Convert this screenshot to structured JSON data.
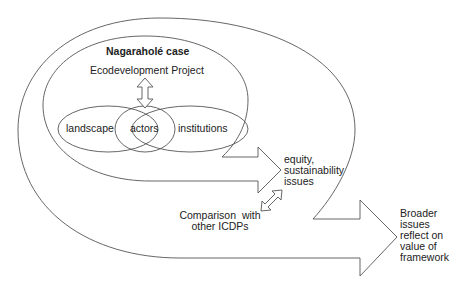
{
  "diagram": {
    "case_title": "Nagaraholé case",
    "project_label": "Ecodevelopment Project",
    "circles": [
      {
        "label": "landscape"
      },
      {
        "label": "actors"
      },
      {
        "label": "institutions"
      }
    ],
    "inner_outcome": {
      "lines": [
        "equity,",
        "sustainability",
        "issues"
      ]
    },
    "comparison": {
      "lines": [
        "Comparison  with",
        "other ICDPs"
      ]
    },
    "outer_outcome": {
      "lines": [
        "Broader",
        "issues",
        "reflect on",
        "value of",
        "framework"
      ]
    },
    "colors": {
      "line": "#555555",
      "text": "#222222",
      "background": "#ffffff"
    }
  }
}
